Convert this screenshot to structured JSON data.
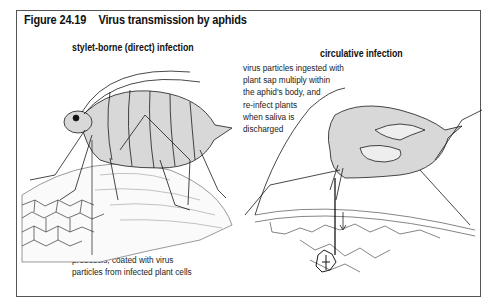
{
  "figure": {
    "number": "Figure 24.19",
    "title": "Virus transmission by aphids"
  },
  "panels": [
    {
      "heading": "stylet-borne (direct) infection",
      "caption_lines": [
        "proboscis, coated with virus",
        "particles from infected plant cells"
      ],
      "illustration": "aphid-feeding-on-leaf-surface"
    },
    {
      "heading": "circulative infection",
      "caption_lines": [
        "virus particles ingested with",
        "plant sap multiply within",
        "the aphid's body, and",
        "re-infect plants",
        "when saliva is",
        "discharged"
      ],
      "illustration": "aphid-cross-section-with-stylet-in-plant-tissue"
    }
  ],
  "colors": {
    "body_fill": "#d8d8d8",
    "line": "#1a1a1a",
    "frame": "#555555"
  }
}
